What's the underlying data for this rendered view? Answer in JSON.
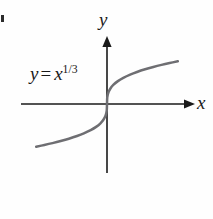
{
  "figure": {
    "background_color": "#fefefe",
    "axis_color": "#1a1a1a",
    "curve_color": "#6e6e72"
  },
  "labels": {
    "y_axis": "y",
    "x_axis": "x",
    "equation": {
      "lhs": "y",
      "operator": "=",
      "base": "x",
      "exponent": "1/3",
      "full_text": "y = x^(1/3)"
    }
  },
  "chart_data": {
    "type": "line",
    "title": "",
    "xlabel": "x",
    "ylabel": "y",
    "legend": [],
    "annotations": [
      {
        "text": "y = x^(1/3)",
        "x": -2.2,
        "y": 0.75
      }
    ],
    "grid": false,
    "axes_style": "arrowed-cartesian-through-origin",
    "xlim": [
      -2.9,
      2.9
    ],
    "ylim": [
      -1.9,
      1.9
    ],
    "series": [
      {
        "name": "y = x^(1/3)",
        "color": "#6e6e72",
        "x": [
          -2.6,
          -2.3,
          -2.0,
          -1.7,
          -1.4,
          -1.1,
          -0.85,
          -0.6,
          -0.4,
          -0.24,
          -0.12,
          -0.05,
          -0.01,
          0.0,
          0.01,
          0.05,
          0.12,
          0.24,
          0.4,
          0.6,
          0.85,
          1.1,
          1.4,
          1.7,
          2.0,
          2.3,
          2.6
        ],
        "y": [
          -1.375,
          -1.32,
          -1.26,
          -1.193,
          -1.119,
          -1.032,
          -0.947,
          -0.843,
          -0.737,
          -0.621,
          -0.493,
          -0.368,
          -0.215,
          0.0,
          0.215,
          0.368,
          0.493,
          0.621,
          0.737,
          0.843,
          0.947,
          1.032,
          1.119,
          1.193,
          1.26,
          1.32,
          1.375
        ]
      }
    ]
  }
}
